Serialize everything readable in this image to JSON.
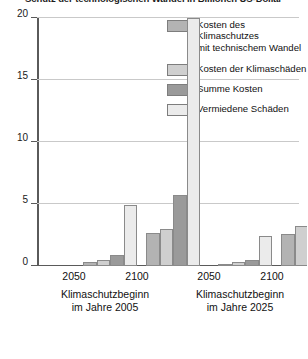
{
  "chart_data": {
    "type": "bar",
    "title": "Schutz der technologischen Wandel in Billionen US-Dollar",
    "xlabel": "",
    "ylabel": "",
    "ylim": [
      0,
      20
    ],
    "yticks": [
      0,
      5,
      10,
      15,
      20
    ],
    "ytick_labels": [
      "0",
      "5",
      "10",
      "15",
      "20"
    ],
    "grid": true,
    "legend_position": "top-right",
    "categories": [
      "2050",
      "2100",
      "2050",
      "2100"
    ],
    "groups": [
      {
        "caption_line1": "Klimaschutzbeginn",
        "caption_line2": "im Jahre 2005",
        "categories": [
          "2050",
          "2100"
        ]
      },
      {
        "caption_line1": "Klimaschutzbeginn",
        "caption_line2": "im Jahre 2025",
        "categories": [
          "2050",
          "2100"
        ]
      }
    ],
    "series": [
      {
        "name": "Kosten des Klimaschutzes mit technischem Wandel",
        "color": "#b3b3b3",
        "values": [
          0.35,
          2.7,
          0.2,
          2.6
        ]
      },
      {
        "name": "Kosten der Klimaschäden",
        "color": "#cfcfcf",
        "values": [
          0.45,
          2.95,
          0.3,
          3.2
        ]
      },
      {
        "name": "Summe Kosten",
        "color": "#9a9a9a",
        "values": [
          0.85,
          5.7,
          0.5,
          6.2
        ]
      },
      {
        "name": "Vermiedene Schäden",
        "color": "#ebebeb",
        "values": [
          4.9,
          20.0,
          2.4,
          11.9
        ]
      }
    ]
  },
  "legend": {
    "items": [
      {
        "label_line1": "Kosten des Klimaschutzes",
        "label_line2": "mit technischem Wandel",
        "color": "#b3b3b3"
      },
      {
        "label_line1": "Kosten der Klimaschäden",
        "label_line2": "",
        "color": "#cfcfcf"
      },
      {
        "label_line1": "Summe Kosten",
        "label_line2": "",
        "color": "#9a9a9a"
      },
      {
        "label_line1": "Vermiedene Schäden",
        "label_line2": "",
        "color": "#ebebeb"
      }
    ]
  },
  "axis": {
    "y_labels": [
      "20",
      "15",
      "10",
      "5",
      "0"
    ]
  },
  "xaxis": {
    "group1_tick": "2050",
    "group2_tick": "2100",
    "group3_tick": "2050",
    "group4_tick": "2100",
    "caption1_line1": "Klimaschutzbeginn",
    "caption1_line2": "im Jahre 2005",
    "caption2_line1": "Klimaschutzbeginn",
    "caption2_line2": "im Jahre 2025"
  },
  "title": "Schutz der technologischen Wandel in Billionen US-Dollar"
}
